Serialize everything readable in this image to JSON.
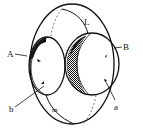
{
  "diagram": {
    "stroke_color": "#111111",
    "shade_color": "#1a1a1a",
    "background": "#ffffff",
    "labels": {
      "A": "A",
      "B": "B",
      "L": "L",
      "a": "a",
      "b": "b",
      "m": "m"
    }
  }
}
